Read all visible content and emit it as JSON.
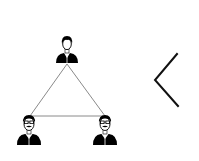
{
  "diagram": {
    "type": "network-triangle",
    "colors": {
      "background": "#ffffff",
      "icon": "#000000",
      "edge": "#8a8a8a",
      "chevron": "#111111"
    },
    "nodes": [
      {
        "id": "top",
        "icon": "person-icon",
        "variant": "plain"
      },
      {
        "id": "bottom-left",
        "icon": "person-glasses-mustache-icon",
        "variant": "glasses-mustache"
      },
      {
        "id": "bottom-right",
        "icon": "person-glasses-mustache-icon",
        "variant": "glasses-mustache"
      }
    ],
    "edges": [
      {
        "from": "top",
        "to": "bottom-left"
      },
      {
        "from": "top",
        "to": "bottom-right"
      },
      {
        "from": "bottom-left",
        "to": "bottom-right"
      }
    ],
    "side_icon": "chevron-left-icon"
  }
}
